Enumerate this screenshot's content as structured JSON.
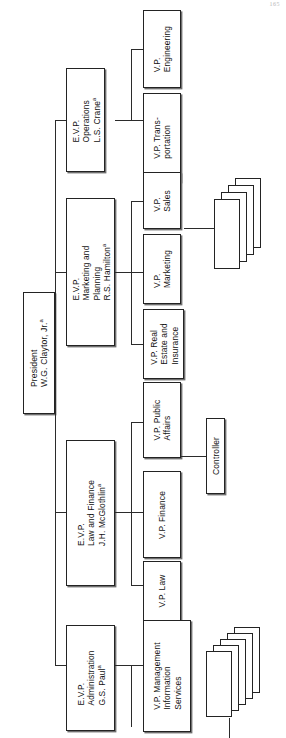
{
  "document": {
    "type": "organization-chart",
    "orientation": "rotated-90-ccw",
    "folio": "165",
    "footnote_marker": "a"
  },
  "org": {
    "root": {
      "title": "President",
      "name": "W.G. Claytor, Jr.",
      "marker": "a"
    },
    "executives": [
      {
        "id": "operations",
        "title": "E.V.P.",
        "unit": "Operations",
        "name": "L.S. Crane",
        "marker": "a",
        "reports": [
          {
            "id": "engineering",
            "label": "V.P.\nEngineering"
          },
          {
            "id": "transportation",
            "label": "V.P. Trans-\nportation"
          }
        ]
      },
      {
        "id": "marketing-planning",
        "title": "E.V.P.",
        "unit": "Marketing and\nPlanning",
        "name": "R.S. Hamilton",
        "marker": "a",
        "reports": [
          {
            "id": "sales",
            "label": "V.P.\nSales"
          },
          {
            "id": "marketing",
            "label": "V.P.\nMarketing"
          },
          {
            "id": "real-estate",
            "label": "V.P. Real\nEstate and\nInsurance"
          }
        ]
      },
      {
        "id": "law-finance",
        "title": "E.V.P.",
        "unit": "Law and Finance",
        "name": "J.H. McGlothlin",
        "marker": "a",
        "reports": [
          {
            "id": "public-affairs",
            "label": "V.P. Public\nAffairs"
          },
          {
            "id": "finance",
            "label": "V.P. Finance"
          },
          {
            "id": "law",
            "label": "V.P. Law"
          }
        ]
      },
      {
        "id": "administration",
        "title": "E.V.P.",
        "unit": "Administration",
        "name": "G.S. Paul",
        "marker": "a",
        "reports": [
          {
            "id": "mis",
            "label": "V.P. Management\nInformation\nServices"
          }
        ]
      }
    ],
    "staff": [
      {
        "id": "controller",
        "label": "Controller",
        "reports_to": "finance"
      }
    ],
    "stacks": [
      {
        "id": "marketing-units-stack",
        "sheets": 4,
        "attached_to": "marketing-planning"
      },
      {
        "id": "mis-units-stack",
        "sheets": 5,
        "attached_to": "administration"
      }
    ]
  }
}
